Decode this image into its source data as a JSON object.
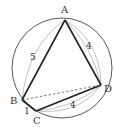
{
  "diagram": {
    "type": "cyclic-quadrilateral",
    "circle": {
      "cx": 62,
      "cy": 68,
      "r": 50
    },
    "points": {
      "A": {
        "label": "A",
        "x": 65,
        "y": 20,
        "lx": 61,
        "ly": 13
      },
      "B": {
        "label": "B",
        "x": 22,
        "y": 100,
        "lx": 10,
        "ly": 104
      },
      "C": {
        "label": "C",
        "x": 36,
        "y": 111,
        "lx": 33,
        "ly": 124
      },
      "D": {
        "label": "D",
        "x": 101,
        "y": 85,
        "lx": 104,
        "ly": 92
      }
    },
    "sides": [
      {
        "from": "A",
        "to": "B",
        "length": "5",
        "lx": 30,
        "ly": 60
      },
      {
        "from": "A",
        "to": "D",
        "length": "4",
        "lx": 86,
        "ly": 49
      },
      {
        "from": "D",
        "to": "C",
        "length": "4",
        "lx": 70,
        "ly": 108
      },
      {
        "from": "B",
        "to": "C",
        "length": "1",
        "lx": 24,
        "ly": 114
      }
    ],
    "diagonal": {
      "from": "B",
      "to": "D",
      "style": "dashed"
    },
    "colors": {
      "line": "#333333",
      "arc": "#aaaaaa"
    }
  }
}
